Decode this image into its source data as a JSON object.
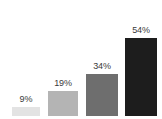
{
  "background_color": "#ffffff",
  "label_color": "#3a3a3a",
  "chart_data": {
    "type": "bar",
    "title": "",
    "subtitle": "",
    "xlabel": "",
    "ylabel": "",
    "grid": false,
    "legend": false,
    "legend_position": "none",
    "axis_visible": false,
    "ylim": [
      0,
      60
    ],
    "categories": [
      "",
      "",
      "",
      ""
    ],
    "data_labels": [
      "9%",
      "19%",
      "34%",
      "54%"
    ],
    "values": [
      9,
      19,
      34,
      54
    ],
    "unit": "%",
    "bars": [
      {
        "index": 0,
        "label": "9%",
        "value": 9,
        "color": "#e3e3e3",
        "left_px": 12,
        "width_px": 28,
        "top_px": 107,
        "height_px": 9
      },
      {
        "index": 1,
        "label": "19%",
        "value": 19,
        "color": "#b4b4b4",
        "left_px": 48,
        "width_px": 30,
        "top_px": 91,
        "height_px": 25
      },
      {
        "index": 2,
        "label": "34%",
        "value": 34,
        "color": "#6e6e6e",
        "left_px": 86,
        "width_px": 32,
        "top_px": 74,
        "height_px": 42
      },
      {
        "index": 3,
        "label": "54%",
        "value": 54,
        "color": "#1d1d1d",
        "left_px": 125,
        "width_px": 32,
        "top_px": 38,
        "height_px": 78
      }
    ]
  }
}
